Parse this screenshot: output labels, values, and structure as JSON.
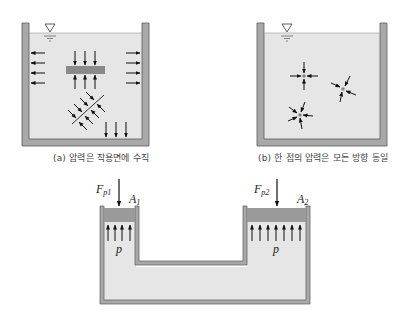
{
  "figure": {
    "panel_a": {
      "caption": "(a) 압력은 작용면에 수직",
      "description": "Tank with free surface; pressure arrows normal to walls, plate, bottom and inclined surfaces"
    },
    "panel_b": {
      "caption": "(b) 한 점의 압력은 모든 방향 동일",
      "description": "Tank with points where pressure arrows act equally from all directions"
    },
    "panel_c": {
      "description": "Hydraulic press connected vessel",
      "labels": {
        "force_left": "F",
        "force_left_sub": "p1",
        "force_right": "F",
        "force_right_sub": "p2",
        "area_left": "A",
        "area_left_sub": "1",
        "area_right": "A",
        "area_right_sub": "2",
        "pressure_left": "p",
        "pressure_right": "p"
      }
    },
    "colors": {
      "water": "#e6e6e6",
      "wall": "#a8a8a8",
      "wall_edge": "#5a5a5a",
      "piston": "#9a9a9a",
      "arrow": "#111111"
    }
  }
}
